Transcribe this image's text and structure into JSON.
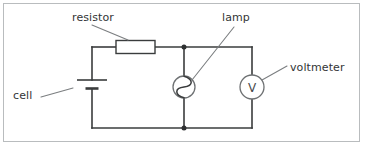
{
  "figure": {
    "type": "circuit-diagram",
    "title": "",
    "border_color": "#b9bcbe",
    "wire_color": "#3a3c3d",
    "leader_color": "#6e7173",
    "text_color": "#333536",
    "background": "#ffffff"
  },
  "labels": {
    "resistor": "resistor",
    "lamp": "lamp",
    "voltmeter": "voltmeter",
    "cell": "cell"
  },
  "symbols": {
    "voltmeter_letter": "V",
    "resistor_shape": "rectangle",
    "lamp_shape": "circle-with-filament",
    "cell_shape": "long-short-plate"
  },
  "components": [
    {
      "name": "resistor",
      "symbol": "rectangle",
      "label": "resistor"
    },
    {
      "name": "cell",
      "symbol": "long-short-plate",
      "label": "cell"
    },
    {
      "name": "lamp",
      "symbol": "circle-with-filament",
      "label": "lamp"
    },
    {
      "name": "voltmeter",
      "symbol": "circle-with-V",
      "label": "voltmeter"
    }
  ],
  "junctions": [
    {
      "name": "top-junction",
      "x": 184,
      "y": 47
    },
    {
      "name": "bottom-junction",
      "x": 184,
      "y": 128
    }
  ]
}
